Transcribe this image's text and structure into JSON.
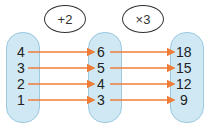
{
  "diagram": {
    "operations": [
      {
        "label": "+2"
      },
      {
        "label": "×3"
      }
    ],
    "sets": [
      {
        "name": "input",
        "values": [
          "4",
          "3",
          "2",
          "1"
        ]
      },
      {
        "name": "middle",
        "values": [
          "6",
          "5",
          "4",
          "3"
        ]
      },
      {
        "name": "output",
        "values": [
          "18",
          "15",
          "12",
          "9"
        ]
      }
    ],
    "arrow_color": "#f07c3a",
    "capsule_color": "#cfe8f4"
  }
}
